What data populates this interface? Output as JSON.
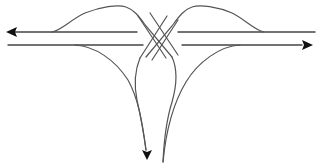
{
  "diagram": {
    "type": "road-interchange",
    "colors": {
      "background": "#ffffff",
      "line": "#555555",
      "arrowhead": "#111111"
    },
    "arrows": [
      {
        "name": "westbound",
        "direction": "left"
      },
      {
        "name": "eastbound",
        "direction": "right"
      },
      {
        "name": "southbound",
        "direction": "down"
      }
    ]
  }
}
